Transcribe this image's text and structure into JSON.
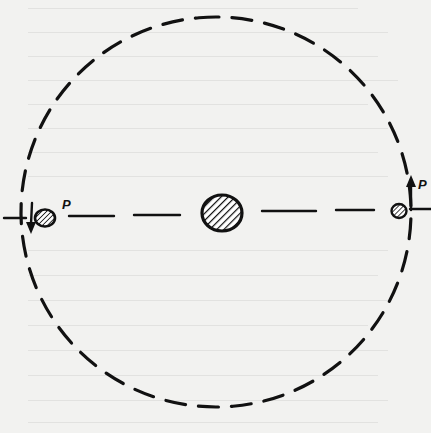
{
  "diagram": {
    "orbit": {
      "cx": 216,
      "cy": 212,
      "r": 195,
      "style": "dashed"
    },
    "central_body": {
      "cx": 222,
      "cy": 213,
      "rx": 20,
      "ry": 18,
      "fill": "hatched"
    },
    "planets": [
      {
        "id": "left",
        "label": "P",
        "cx": 45,
        "cy": 219,
        "r": 9,
        "arrow": "down"
      },
      {
        "id": "right",
        "label": "P",
        "cx": 401,
        "cy": 211,
        "r": 7,
        "arrow": "up"
      }
    ],
    "line_of_apsides": {
      "y": 215,
      "style": "dashed"
    },
    "colors": {
      "ink": "#111111",
      "paper": "#f2f2f0",
      "bleed": "#e2e2e0"
    }
  }
}
